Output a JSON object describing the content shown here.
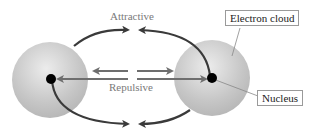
{
  "diagram": {
    "labels": {
      "attractive": "Attractive",
      "repulsive": "Repulsive",
      "electron_cloud": "Electron cloud",
      "nucleus": "Nucleus"
    },
    "colors": {
      "cloud": "#c8c8c8",
      "attractive_arrow": "#3a3a3a",
      "repulsive_arrow": "#6e6e6e",
      "nucleus": "#000000",
      "label_text": "#7a7a7a"
    },
    "atoms": [
      {
        "name": "left-atom",
        "cx": 50,
        "cy": 80,
        "r": 38
      },
      {
        "name": "right-atom",
        "cx": 212,
        "cy": 78,
        "r": 38
      }
    ]
  }
}
